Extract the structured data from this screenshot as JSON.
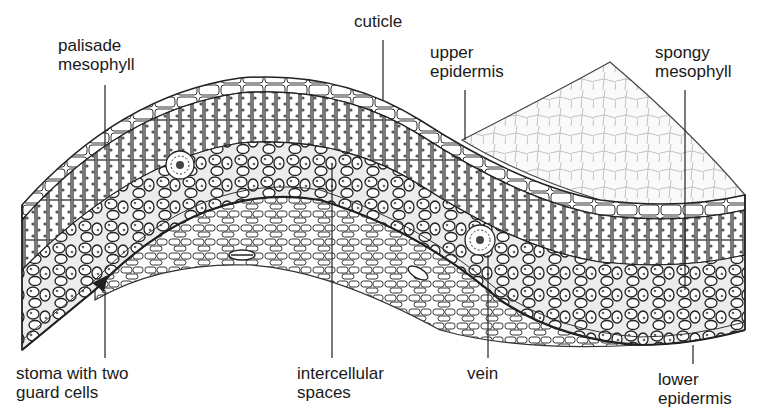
{
  "diagram": {
    "labels": {
      "palisade": [
        "palisade",
        "mesophyll"
      ],
      "cuticle": [
        "cuticle"
      ],
      "upper_epidermis": [
        "upper",
        "epidermis"
      ],
      "spongy": [
        "spongy",
        "mesophyll"
      ],
      "stoma": [
        "stoma with two",
        "guard cells"
      ],
      "intercellular": [
        "intercellular",
        "spaces"
      ],
      "vein": [
        "vein"
      ],
      "lower_epidermis": [
        "lower",
        "epidermis"
      ]
    },
    "colors": {
      "ink": "#1a1a1a",
      "paper": "#ffffff",
      "dots": "#555555",
      "cell": "#f4f4f4"
    }
  }
}
